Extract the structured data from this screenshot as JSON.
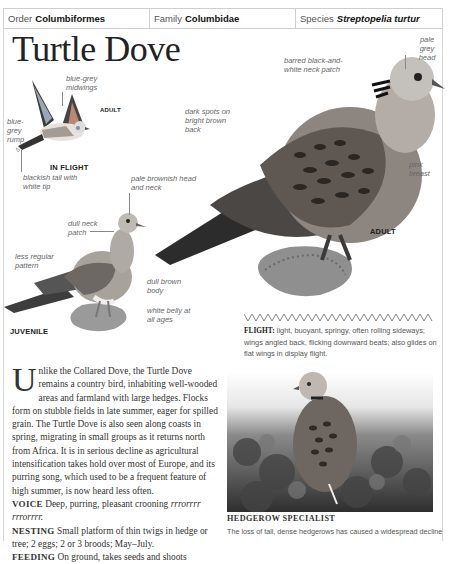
{
  "header": {
    "order_label": "Order",
    "order_value": "Columbiformes",
    "family_label": "Family",
    "family_value": "Columbidae",
    "species_label": "Species",
    "species_value": "Streptopelia turtur"
  },
  "title": "Turtle Dove",
  "illustrations": {
    "flight": {
      "tag": "ADULT",
      "caption": "IN FLIGHT",
      "labels": {
        "midwings": "blue-grey midwings",
        "rump": "blue- grey rump",
        "tail": "blackish tail with white tip"
      }
    },
    "juvenile": {
      "caption": "JUVENILE",
      "labels": {
        "head": "pale brownish head and neck",
        "neck": "dull neck patch",
        "pattern": "less regular pattern",
        "body": "dull brown body",
        "belly": "white belly at all ages"
      }
    },
    "adult": {
      "caption": "ADULT",
      "labels": {
        "head": "pale grey head",
        "neck": "barred black-and- white neck patch",
        "back": "dark spots on bright brown back",
        "breast": "pink breast"
      }
    }
  },
  "flight_note": {
    "label": "FLIGHT:",
    "text": "light, buoyant, springy, often rolling sideways; wings angled back, flicking downward beats; also glides on flat wings in display flight."
  },
  "body": {
    "drop_cap": "U",
    "intro": "nlike the Collared Dove, the Turtle Dove remains a country bird, inhabiting well-wooded areas and farmland with large hedges. Flocks form on stubble fields in late summer, eager for spilled grain. The Turtle Dove is also seen along coasts in spring, migrating in small groups as it returns north from Africa. It is in serious decline as agricultural intensification takes hold over most of Europe, and its purring song, which used to be a frequent feature of high summer, is now heard less often.",
    "voice_label": "VOICE",
    "voice_text": "Deep, purring, pleasant crooning",
    "voice_call": "rrrorrrr rrrorrrr.",
    "nesting_label": "NESTING",
    "nesting_text": "Small platform of thin twigs in hedge or tree; 2 eggs; 2 or 3 broods; May–July.",
    "feeding_label": "FEEDING",
    "feeding_text": "On ground, takes seeds and shoots"
  },
  "photo": {
    "caption": "HEDGEROW SPECIALIST",
    "text": "The loss of tall, dense hedgerows has caused a widespread decline"
  }
}
